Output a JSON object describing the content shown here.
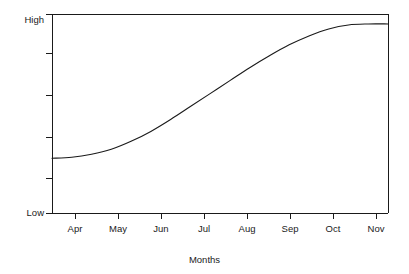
{
  "chart_data": {
    "type": "line",
    "title": "",
    "subtitle": "",
    "xlabel": "Months",
    "ylabel": "",
    "grid": false,
    "legend": false,
    "legend_position": "none",
    "line_color": "#1a1a1a",
    "background_color": "#ffffff",
    "x_tick_labels": [
      "Apr",
      "May",
      "Jun",
      "Jul",
      "Aug",
      "Sep",
      "Oct",
      "Nov"
    ],
    "y_tick_labels": [
      "Low",
      "",
      "",
      "",
      "",
      "High"
    ],
    "y_axis_low_label": "Low",
    "y_axis_high_label": "High",
    "ylim": [
      0,
      100
    ],
    "xlim": [
      0,
      8.5
    ],
    "series": [
      {
        "name": "growth",
        "x": [
          0.0,
          0.5,
          1.0,
          1.5,
          2.0,
          2.5,
          3.0,
          3.5,
          4.0,
          4.5,
          5.0,
          5.5,
          6.0,
          6.5,
          7.0,
          7.5,
          8.0,
          8.5
        ],
        "values": [
          27.5,
          28.0,
          29.5,
          32.0,
          36.0,
          41.0,
          47.0,
          53.5,
          60.0,
          66.5,
          73.0,
          79.0,
          84.5,
          89.0,
          92.5,
          94.5,
          95.0,
          95.0
        ]
      }
    ]
  },
  "axis_geometry": {
    "plot_left": 52,
    "plot_right": 388,
    "plot_top": 14,
    "plot_bottom": 213,
    "x_tick_positions": [
      75,
      118,
      161,
      204,
      247,
      290,
      333,
      376
    ],
    "y_tick_positions": [
      53,
      95,
      137,
      178
    ]
  }
}
